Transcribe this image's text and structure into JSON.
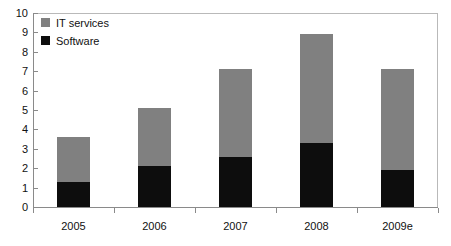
{
  "chart_data": {
    "type": "bar",
    "subtype": "stacked-bar",
    "title": "",
    "xlabel": "",
    "ylabel": "",
    "categories": [
      "2005",
      "2006",
      "2007",
      "2008",
      "2009e"
    ],
    "series": [
      {
        "name": "Software",
        "color": "#0d0d0d",
        "values": [
          1.3,
          2.1,
          2.6,
          3.3,
          1.9
        ]
      },
      {
        "name": "IT services",
        "color": "#808080",
        "values": [
          2.3,
          3.0,
          4.5,
          5.6,
          5.2
        ]
      }
    ],
    "totals": [
      3.6,
      5.1,
      7.1,
      8.9,
      7.1
    ],
    "stack_order": [
      "Software",
      "IT services"
    ],
    "ylim": [
      0,
      10
    ],
    "ytick_labels": [
      "0",
      "1",
      "2",
      "3",
      "4",
      "5",
      "6",
      "7",
      "8",
      "9",
      "10"
    ],
    "ytick_values": [
      0,
      1,
      2,
      3,
      4,
      5,
      6,
      7,
      8,
      9,
      10
    ],
    "grid": false,
    "legend_position": "top-left",
    "legend_entries": [
      {
        "label": "IT services",
        "color": "#808080"
      },
      {
        "label": "Software",
        "color": "#0d0d0d"
      }
    ]
  },
  "colors": {
    "it_services": "#808080",
    "software": "#0d0d0d",
    "axis": "#8a8a8a",
    "frame": "#b9b9b9",
    "text": "#111111",
    "background": "#ffffff"
  }
}
